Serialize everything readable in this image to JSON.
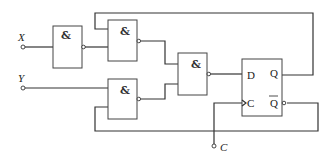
{
  "diagram": {
    "type": "logic-circuit",
    "inputs": [
      {
        "id": "X",
        "label": "X"
      },
      {
        "id": "Y",
        "label": "Y"
      },
      {
        "id": "C",
        "label": "C"
      }
    ],
    "gates": [
      {
        "id": "G1",
        "type": "NAND",
        "symbol": "&",
        "inputs": [
          "X"
        ],
        "output": "G1"
      },
      {
        "id": "G2",
        "type": "NAND",
        "symbol": "&",
        "inputs": [
          "Q",
          "G1"
        ],
        "output": "G2"
      },
      {
        "id": "G3",
        "type": "NAND",
        "symbol": "&",
        "inputs": [
          "Y",
          "Qbar"
        ],
        "output": "G3"
      },
      {
        "id": "G4",
        "type": "NAND",
        "symbol": "&",
        "inputs": [
          "G2",
          "G3"
        ],
        "output": "D"
      }
    ],
    "flipflop": {
      "type": "D flip-flop",
      "d_label": "D",
      "q_label": "Q",
      "c_label": "C",
      "qbar_label": "Q",
      "clock_edge": "rising"
    },
    "stroke_color": "#333333",
    "background": "#ffffff"
  }
}
